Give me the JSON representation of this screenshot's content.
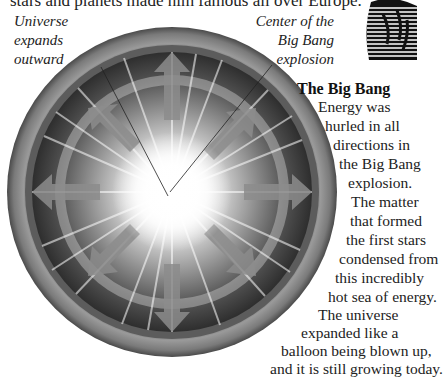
{
  "top_text": "stars and planets made him famous all over Europe.",
  "captions": {
    "left": [
      "Universe",
      "expands",
      "outward"
    ],
    "right": [
      "Center of the",
      "Big Bang",
      "explosion"
    ]
  },
  "sidebar": {
    "heading": "The Big Bang",
    "lines": [
      "Energy was",
      "hurled in all",
      "directions in",
      "the Big Bang",
      "explosion.",
      "The matter",
      "that formed",
      "the first stars",
      "condensed from",
      "this incredibly",
      "hot sea of energy.",
      "The universe",
      "expanded like a",
      "balloon being blown up,",
      "and it is still growing today."
    ]
  },
  "illustration": {
    "subject": "big-bang-explosion",
    "colors": {
      "outer_ring": "#6e6e6e",
      "arrows": "#8a8a8a",
      "core": "#ffffff"
    }
  }
}
